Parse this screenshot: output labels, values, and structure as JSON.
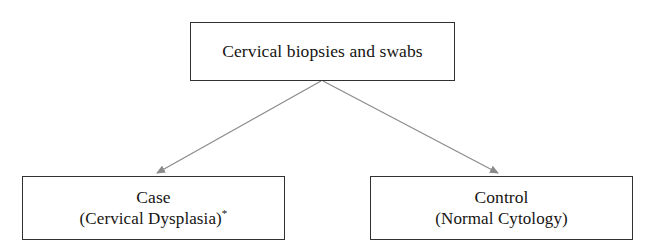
{
  "diagram": {
    "type": "flowchart",
    "orientation": "top-down",
    "background_color": "#ffffff",
    "box_border_color": "#33312f",
    "connector_color": "#808080",
    "nodes": [
      {
        "id": "source",
        "role": "parent",
        "label": "Cervical biopsies and swabs",
        "lines": [
          "Cervical biopsies and swabs"
        ]
      },
      {
        "id": "case",
        "role": "child-left",
        "title": "Case",
        "subtitle": "(Cervical Dysplasia)",
        "footnote_marker": "*"
      },
      {
        "id": "control",
        "role": "child-right",
        "title": "Control",
        "subtitle": "(Normal Cytology)"
      }
    ],
    "connectors": [
      {
        "id": "source-to-case",
        "from": "source",
        "to": "case",
        "style": "solid-arrow",
        "arrowhead": "filled-triangle"
      },
      {
        "id": "source-to-control",
        "from": "source",
        "to": "control",
        "style": "solid-arrow",
        "arrowhead": "filled-triangle"
      }
    ]
  }
}
